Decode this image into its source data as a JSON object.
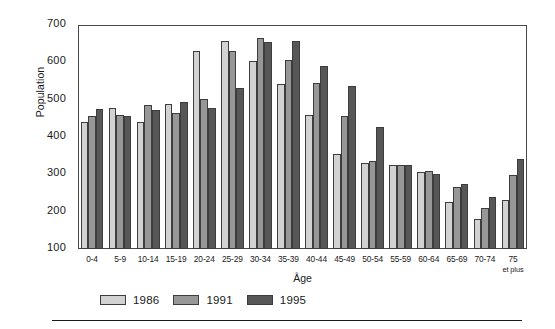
{
  "chart_data": {
    "type": "bar",
    "title": "",
    "xlabel": "Âge",
    "ylabel": "Population",
    "ylim": [
      100,
      700
    ],
    "yticks": [
      100,
      200,
      300,
      400,
      500,
      600,
      700
    ],
    "grid": false,
    "legend_position": "bottom-left",
    "categories": [
      "0-4",
      "5-9",
      "10-14",
      "15-19",
      "20-24",
      "25-29",
      "30-34",
      "35-39",
      "40-44",
      "45-49",
      "50-54",
      "55-59",
      "60-64",
      "65-69",
      "70-74",
      "75"
    ],
    "category_sublabels": [
      "",
      "",
      "",
      "",
      "",
      "",
      "",
      "",
      "",
      "",
      "",
      "",
      "",
      "",
      "",
      "et plus"
    ],
    "series": [
      {
        "name": "1986",
        "color": "#d2d2d2",
        "values": [
          440,
          478,
          440,
          488,
          630,
          658,
          603,
          543,
          460,
          355,
          330,
          325,
          305,
          225,
          180,
          230
        ]
      },
      {
        "name": "1991",
        "color": "#979797",
        "values": [
          455,
          460,
          485,
          465,
          502,
          630,
          665,
          605,
          545,
          455,
          335,
          325,
          310,
          265,
          210,
          298
        ]
      },
      {
        "name": "1995",
        "color": "#575757",
        "values": [
          475,
          455,
          473,
          495,
          478,
          530,
          655,
          658,
          590,
          537,
          428,
          325,
          300,
          275,
          238,
          340
        ]
      }
    ]
  },
  "legend": {
    "items": [
      {
        "label": "1986",
        "swatch": "#d2d2d2"
      },
      {
        "label": "1991",
        "swatch": "#979797"
      },
      {
        "label": "1995",
        "swatch": "#575757"
      }
    ]
  }
}
